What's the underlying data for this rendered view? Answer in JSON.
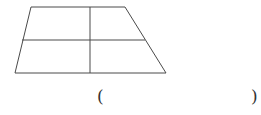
{
  "figure": {
    "shape": "trapezoid",
    "divided_into_parts": 4,
    "stroke_color": "#4a4a4a",
    "vertices": {
      "top_left": [
        31,
        7
      ],
      "top_right": [
        125,
        7
      ],
      "bottom_right": [
        166,
        73
      ],
      "bottom_left": [
        15,
        73
      ]
    },
    "middle_line": {
      "from": [
        22,
        40
      ],
      "to": [
        145,
        40
      ]
    },
    "vertical_line": {
      "from": [
        90,
        7
      ],
      "to": [
        90,
        73
      ]
    }
  },
  "answer": {
    "open_paren": "(",
    "close_paren": ")",
    "value": ""
  }
}
